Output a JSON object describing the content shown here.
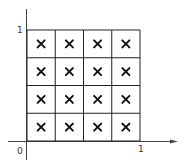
{
  "diagram": {
    "type": "unit-square-grid",
    "grid": {
      "rows": 4,
      "cols": 4,
      "marker": "×"
    },
    "axes": {
      "origin_label": "0",
      "x_tick_label": "1",
      "y_tick_label": "1"
    },
    "colors": {
      "line": "#222222",
      "axis": "#444444",
      "background": "#ffffff"
    }
  }
}
